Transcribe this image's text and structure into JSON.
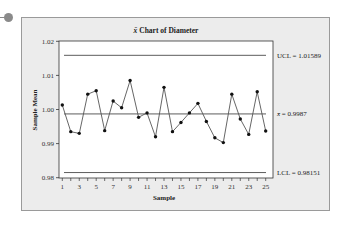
{
  "chart_data": {
    "type": "line",
    "title": "x̄ Chart of Diameter",
    "title_symbol": "x̄",
    "title_text": "Chart of Diameter",
    "xlabel": "Sample",
    "ylabel": "Sample Mean",
    "x": [
      1,
      2,
      3,
      4,
      5,
      6,
      7,
      8,
      9,
      10,
      11,
      12,
      13,
      14,
      15,
      16,
      17,
      18,
      19,
      20,
      21,
      22,
      23,
      24,
      25
    ],
    "values": [
      1.0013,
      0.9935,
      0.993,
      1.0045,
      1.0055,
      0.9938,
      1.0025,
      1.0005,
      1.0085,
      0.9977,
      0.999,
      0.992,
      1.0065,
      0.9935,
      0.9962,
      0.999,
      1.0018,
      0.9965,
      0.9917,
      0.9903,
      1.0045,
      0.9972,
      0.9927,
      1.0052,
      0.9937
    ],
    "x_ticks": [
      "1",
      "3",
      "5",
      "7",
      "9",
      "11",
      "13",
      "15",
      "17",
      "19",
      "21",
      "23",
      "25"
    ],
    "y_ticks": [
      "0.98",
      "0.99",
      "1.00",
      "1.01",
      "1.02"
    ],
    "ylim": [
      0.98,
      1.02
    ],
    "xlim": [
      1,
      25
    ],
    "grid": false,
    "control_lines": {
      "ucl": {
        "value": 1.01589,
        "label": "UCL = 1.01589"
      },
      "center": {
        "value": 0.9987,
        "label": "= 0.9987",
        "symbol": "x̄"
      },
      "lcl": {
        "value": 0.98151,
        "label": "LCL = 0.98151"
      }
    }
  }
}
